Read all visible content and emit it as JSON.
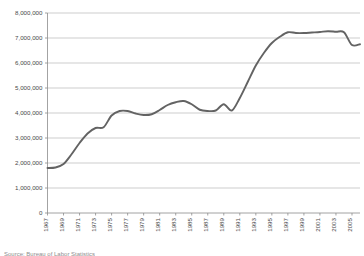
{
  "chart_data": {
    "type": "line",
    "title": "",
    "xlabel": "",
    "ylabel": "",
    "ylim": [
      0,
      8000000
    ],
    "xlim": [
      1967,
      2006
    ],
    "grid": true,
    "legend": false,
    "y_ticks": [
      0,
      1000000,
      2000000,
      3000000,
      4000000,
      5000000,
      6000000,
      7000000,
      8000000
    ],
    "y_tick_labels": [
      "0",
      "1,000,000",
      "2,000,000",
      "3,000,000",
      "4,000,000",
      "5,000,000",
      "6,000,000",
      "7,000,000",
      "8,000,000"
    ],
    "x_tick_labels": [
      "1967",
      "1969",
      "1971",
      "1973",
      "1975",
      "1977",
      "1979",
      "1981",
      "1983",
      "1985",
      "1987",
      "1989",
      "1991",
      "1993",
      "1995",
      "1997",
      "1999",
      "2001",
      "2003",
      "2005"
    ],
    "x": [
      1967,
      1968,
      1969,
      1970,
      1971,
      1972,
      1973,
      1974,
      1975,
      1976,
      1977,
      1978,
      1979,
      1980,
      1981,
      1982,
      1983,
      1984,
      1985,
      1986,
      1987,
      1988,
      1989,
      1990,
      1991,
      1992,
      1993,
      1994,
      1995,
      1996,
      1997,
      1998,
      1999,
      2000,
      2001,
      2002,
      2003,
      2004,
      2005,
      2006
    ],
    "values": [
      1800000,
      1820000,
      1960000,
      2350000,
      2800000,
      3180000,
      3400000,
      3430000,
      3900000,
      4080000,
      4080000,
      3980000,
      3920000,
      3950000,
      4120000,
      4320000,
      4430000,
      4480000,
      4350000,
      4130000,
      4080000,
      4100000,
      4350000,
      4100000,
      4600000,
      5250000,
      5900000,
      6400000,
      6800000,
      7050000,
      7230000,
      7200000,
      7200000,
      7220000,
      7240000,
      7270000,
      7250000,
      7230000,
      6720000,
      6750000
    ],
    "series_name": "",
    "line_color": "#636363",
    "grid_color": "#b8b8b8",
    "axis_color": "#8c8c8c"
  },
  "footer": {
    "source_note": "Source: Bureau of Labor Statistics"
  }
}
